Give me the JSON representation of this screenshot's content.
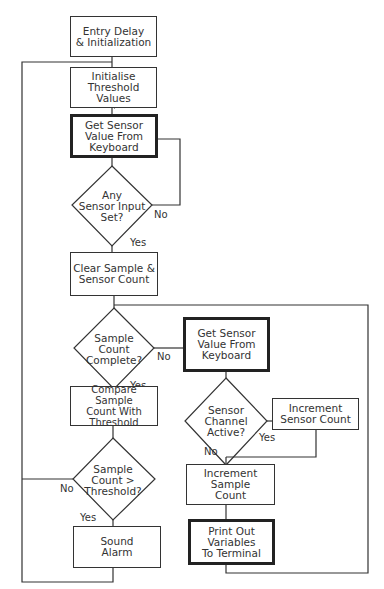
{
  "diagram": {
    "type": "flowchart",
    "nodes": {
      "entry": "Entry Delay\n& Initialization",
      "init_threshold": "Initialise\nThreshold\nValues",
      "get_sensor_1": "Get Sensor\nValue From\nKeyboard",
      "any_input": "Any\nSensor Input\nSet?",
      "clear_counts": "Clear Sample  &\nSensor Count",
      "sample_complete": "Sample\nCount\nComplete?",
      "get_sensor_2": "Get Sensor\nValue From\nKeyboard",
      "compare": "Compare Sample\nCount With\nThreshold",
      "channel_active": "Sensor\nChannel\nActive?",
      "inc_sensor": "Increment\nSensor Count",
      "inc_sample": "Increment\nSample\nCount",
      "count_gt": "Sample\nCount >\nThreshold?",
      "alarm": "Sound\nAlarm",
      "print": "Print Out\nVariables\nTo Terminal"
    },
    "labels": {
      "any_no": "No",
      "any_yes": "Yes",
      "complete_no": "No",
      "complete_yes": "Yes",
      "channel_yes": "Yes",
      "channel_no": "No",
      "gt_no": "No",
      "gt_yes": "Yes"
    }
  }
}
